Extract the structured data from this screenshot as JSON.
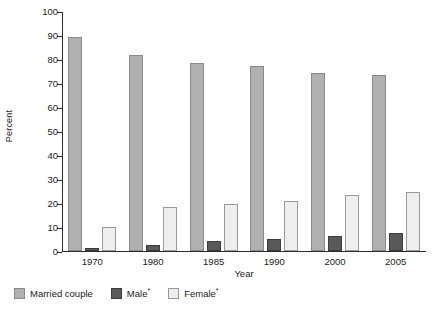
{
  "chart_data": {
    "type": "bar",
    "title": "",
    "subtitle": "",
    "xlabel": "Year",
    "ylabel": "Percent",
    "categories": [
      "1970",
      "1980",
      "1985",
      "1990",
      "2000",
      "2005"
    ],
    "series": [
      {
        "name": "Married couple",
        "legend_label": "Married couple",
        "footnote_marker": "",
        "color": "#b0b0b0",
        "edge_color": "#8a8a8a",
        "values": [
          89,
          81.5,
          78.5,
          77,
          74,
          73.5
        ]
      },
      {
        "name": "Male",
        "legend_label": "Male",
        "footnote_marker": "*",
        "color": "#595959",
        "edge_color": "#3d3d3d",
        "values": [
          1.2,
          2.5,
          4,
          5,
          6.2,
          7.3
        ]
      },
      {
        "name": "Female",
        "legend_label": "Female",
        "footnote_marker": "*",
        "color": "#eeeeee",
        "edge_color": "#9a9a9a",
        "values": [
          10,
          18.5,
          19.5,
          21,
          23.3,
          24.5
        ]
      }
    ],
    "ylim": [
      0,
      100
    ],
    "ytick_values": [
      0,
      10,
      20,
      30,
      40,
      50,
      60,
      70,
      80,
      90,
      100
    ],
    "ytick_labels": [
      "0",
      "10",
      "20",
      "30",
      "40",
      "50",
      "60",
      "70",
      "80",
      "90",
      "100"
    ],
    "grid": false,
    "legend_position": "below-left",
    "axis_color": "#2b2b2b",
    "background": "#ffffff"
  }
}
